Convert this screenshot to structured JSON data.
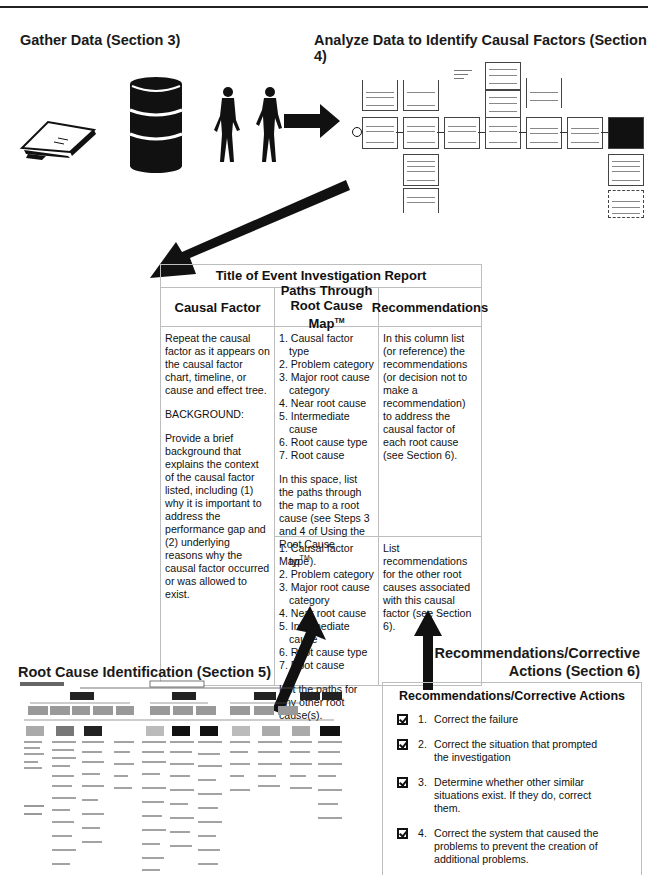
{
  "sections": {
    "gather": "Gather Data (Section 3)",
    "analyze": "Analyze Data to Identify Causal Factors (Section 4)",
    "root_cause": "Root Cause Identification (Section 5)",
    "recommendations_line1": "Recommendations/Corrective",
    "recommendations_line2": "Actions (Section 6)"
  },
  "icons": [
    "documents-icon",
    "barrel-icon",
    "people-icon",
    "arrow-right-icon"
  ],
  "report": {
    "title": "Title of Event Investigation Report",
    "headers": {
      "causal_factor": "Causal Factor",
      "paths_line1": "Paths Through",
      "paths_line2": "Root Cause Map",
      "paths_tm": "TM",
      "recommendations": "Recommendations"
    },
    "causal_factor_cell": {
      "p1": "Repeat the causal factor as it appears on the causal factor chart, timeline, or cause and effect tree.",
      "p2": "BACKGROUND:",
      "p3": "Provide a brief background that explains the context of the causal factor listed, including (1) why it is important to address the performance gap and (2) underlying reasons why the causal factor occurred or was allowed to exist."
    },
    "paths_top": {
      "items": [
        "1. Causal factor type",
        "2. Problem category",
        "3. Major root cause category",
        "4. Near root cause",
        "5. Intermediate cause",
        "6. Root cause type",
        "7. Root cause"
      ],
      "note": "In this space, list the paths through the map to a root cause (see Steps 3 and 4 of Using the Root Cause Map",
      "note_tm": "TM",
      "note_end": ")."
    },
    "paths_bottom": {
      "items": [
        "1. Causal factor type",
        "2. Problem category",
        "3. Major root cause category",
        "4. Near root cause",
        "5. Intermediate cause",
        "6. Root cause type",
        "7. Root cause"
      ],
      "note": "List the paths for any other root cause(s)."
    },
    "rec_top": "In this column list (or reference) the recommendations (or decision not to make a recommendation) to address the causal factor of each root cause (see Section 6).",
    "rec_bottom": "List recommendations for the other root causes associated with this causal factor (see Section 6)."
  },
  "corrective_actions": {
    "title": "Recommendations/Corrective Actions",
    "items": [
      {
        "num": "1.",
        "text": "Correct the failure",
        "checked": true
      },
      {
        "num": "2.",
        "text": "Correct the situation that prompted the investigation",
        "checked": true
      },
      {
        "num": "3.",
        "text": "Determine whether other similar situations exist. If they do, correct them.",
        "checked": true
      },
      {
        "num": "4.",
        "text": "Correct the system that caused the problems to prevent the creation of additional problems.",
        "checked": true
      }
    ]
  },
  "colors": {
    "text": "#111111",
    "border": "#bdbdbd",
    "arrow": "#111111"
  }
}
